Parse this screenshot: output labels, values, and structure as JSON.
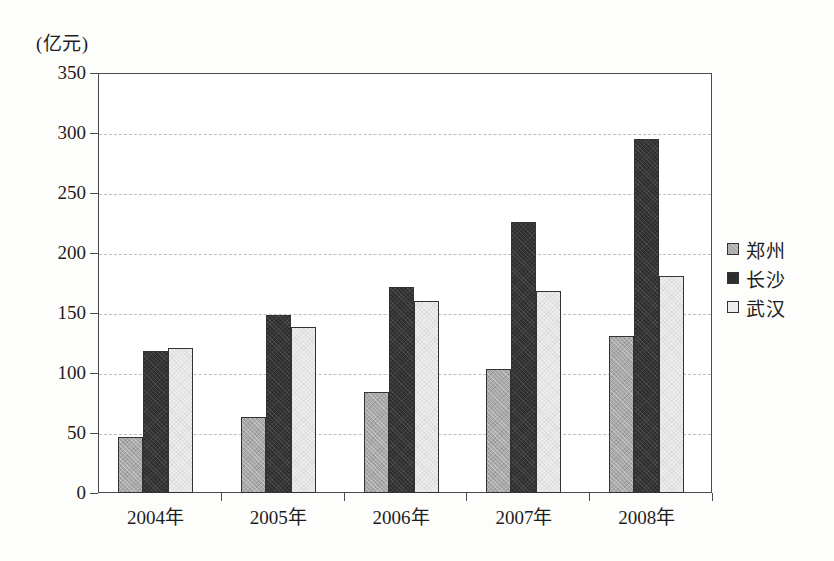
{
  "chart_data": {
    "type": "bar",
    "title": "",
    "subtitle": "",
    "unit_label": "(亿元)",
    "xlabel": "",
    "ylabel": "",
    "categories": [
      "2004年",
      "2005年",
      "2006年",
      "2007年",
      "2008年"
    ],
    "series": [
      {
        "name": "郑州",
        "color": "#a9a9a9",
        "values": [
          47,
          63,
          84,
          103,
          131
        ]
      },
      {
        "name": "长沙",
        "color": "#2e2e2e",
        "values": [
          118,
          148,
          172,
          226,
          295
        ]
      },
      {
        "name": "武汉",
        "color": "#ededed",
        "values": [
          121,
          138,
          160,
          168,
          181
        ]
      }
    ],
    "ylim": [
      0,
      350
    ],
    "yticks": [
      0,
      50,
      100,
      150,
      200,
      250,
      300,
      350
    ],
    "ytick_labels": [
      "0",
      "50",
      "100",
      "150",
      "200",
      "250",
      "300",
      "350"
    ],
    "grid": true,
    "grid_style": "dashed",
    "legend_position": "right"
  }
}
